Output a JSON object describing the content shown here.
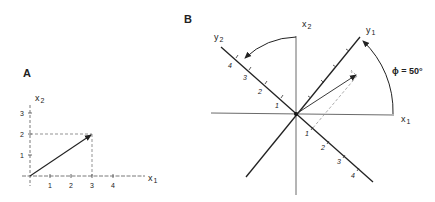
{
  "panels": {
    "A": {
      "label": "A",
      "x_axis_label": "x",
      "x_axis_sub": "1",
      "y_axis_label": "x",
      "y_axis_sub": "2",
      "x_ticks": [
        "1",
        "2",
        "3",
        "4"
      ],
      "y_ticks": [
        "1",
        "2",
        "3"
      ],
      "vector": {
        "x": 3,
        "y": 2
      }
    },
    "B": {
      "label": "B",
      "x1_label": "x",
      "x1_sub": "1",
      "x2_label": "x",
      "x2_sub": "2",
      "y1_label": "y",
      "y1_sub": "1",
      "y2_label": "y",
      "y2_sub": "2",
      "angle_text": "ϕ = 50°",
      "y2_ticks": [
        "1",
        "2",
        "3",
        "4"
      ],
      "y1_neg_ticks": [
        "1",
        "2",
        "3",
        "4"
      ]
    }
  },
  "colors": {
    "ink": "#222222",
    "dash": "#777777"
  }
}
